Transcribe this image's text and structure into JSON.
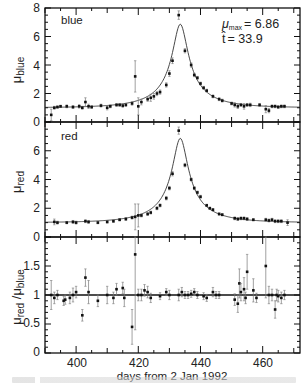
{
  "chart_data": [
    {
      "type": "scatter",
      "panel": "top",
      "panel_label": "blue",
      "ylabel": "μ_blue",
      "ylabel_main": "μ",
      "ylabel_sub": "blue",
      "xlabel": "days from 2 Jan 1992",
      "xlim": [
        390,
        472
      ],
      "ylim": [
        0,
        8
      ],
      "yticks": [
        0,
        2,
        4,
        6,
        8
      ],
      "xticks": [
        400,
        420,
        440,
        460
      ],
      "annotations": {
        "mu_max_label": "μ",
        "mu_max_sub": "max",
        "mu_max_value": "= 6.86",
        "t_hat_label": "t̂",
        "t_hat_value": "= 33.9"
      },
      "fit_curve": {
        "model": "microlensing",
        "t0": 433.5,
        "umin_peak": 6.86,
        "tE": 33.9
      },
      "points": [
        {
          "x": 392,
          "y": 0.5,
          "err": 0.4
        },
        {
          "x": 393,
          "y": 1.0,
          "err": 0.1
        },
        {
          "x": 394,
          "y": 1.05,
          "err": 0.08
        },
        {
          "x": 395,
          "y": 1.1,
          "err": 0.08
        },
        {
          "x": 397,
          "y": 1.1,
          "err": 0.1
        },
        {
          "x": 399,
          "y": 1.05,
          "err": 0.1
        },
        {
          "x": 401,
          "y": 1.1,
          "err": 0.12
        },
        {
          "x": 402,
          "y": 1.0,
          "err": 0.1
        },
        {
          "x": 403,
          "y": 1.4,
          "err": 0.3
        },
        {
          "x": 404,
          "y": 1.1,
          "err": 0.15
        },
        {
          "x": 405,
          "y": 1.05,
          "err": 0.1
        },
        {
          "x": 408,
          "y": 1.15,
          "err": 0.1
        },
        {
          "x": 410,
          "y": 1.0,
          "err": 0.15
        },
        {
          "x": 411,
          "y": 1.1,
          "err": 0.1
        },
        {
          "x": 413,
          "y": 1.2,
          "err": 0.1
        },
        {
          "x": 414,
          "y": 1.2,
          "err": 0.1
        },
        {
          "x": 415,
          "y": 1.15,
          "err": 0.12
        },
        {
          "x": 416,
          "y": 1.2,
          "err": 0.1
        },
        {
          "x": 418,
          "y": 1.3,
          "err": 0.12
        },
        {
          "x": 419,
          "y": 3.2,
          "err": 1.1
        },
        {
          "x": 420,
          "y": 1.1,
          "err": 0.6
        },
        {
          "x": 421,
          "y": 1.4,
          "err": 0.2
        },
        {
          "x": 423,
          "y": 1.6,
          "err": 0.15
        },
        {
          "x": 424,
          "y": 1.7,
          "err": 0.25
        },
        {
          "x": 425,
          "y": 1.8,
          "err": 0.2
        },
        {
          "x": 426,
          "y": 2.0,
          "err": 0.15
        },
        {
          "x": 427,
          "y": 2.1,
          "err": 0.15
        },
        {
          "x": 429,
          "y": 2.6,
          "err": 0.15
        },
        {
          "x": 430,
          "y": 3.4,
          "err": 0.2
        },
        {
          "x": 431,
          "y": 4.3,
          "err": 0.2
        },
        {
          "x": 433,
          "y": 7.5,
          "err": 0.3
        },
        {
          "x": 435,
          "y": 5.0,
          "err": 0.15
        },
        {
          "x": 437,
          "y": 4.0,
          "err": 0.15
        },
        {
          "x": 438,
          "y": 3.3,
          "err": 0.12
        },
        {
          "x": 439,
          "y": 3.1,
          "err": 0.1
        },
        {
          "x": 440,
          "y": 2.7,
          "err": 0.1
        },
        {
          "x": 441,
          "y": 2.4,
          "err": 0.1
        },
        {
          "x": 442,
          "y": 2.2,
          "err": 0.1
        },
        {
          "x": 444,
          "y": 1.8,
          "err": 0.1
        },
        {
          "x": 446,
          "y": 1.6,
          "err": 0.1
        },
        {
          "x": 447,
          "y": 1.5,
          "err": 0.1
        },
        {
          "x": 450,
          "y": 1.3,
          "err": 0.1
        },
        {
          "x": 451,
          "y": 1.2,
          "err": 0.15
        },
        {
          "x": 452,
          "y": 1.1,
          "err": 0.15
        },
        {
          "x": 453,
          "y": 1.2,
          "err": 0.1
        },
        {
          "x": 454,
          "y": 1.1,
          "err": 0.2
        },
        {
          "x": 455,
          "y": 1.2,
          "err": 0.1
        },
        {
          "x": 456,
          "y": 1.2,
          "err": 0.12
        },
        {
          "x": 459,
          "y": 1.2,
          "err": 0.1
        },
        {
          "x": 461,
          "y": 0.9,
          "err": 0.25
        },
        {
          "x": 462,
          "y": 0.8,
          "err": 0.15
        },
        {
          "x": 463,
          "y": 1.1,
          "err": 0.1
        },
        {
          "x": 464,
          "y": 1.1,
          "err": 0.1
        },
        {
          "x": 465,
          "y": 1.05,
          "err": 0.1
        },
        {
          "x": 466,
          "y": 1.1,
          "err": 0.1
        },
        {
          "x": 467,
          "y": 1.1,
          "err": 0.1
        }
      ]
    },
    {
      "type": "scatter",
      "panel": "middle",
      "panel_label": "red",
      "ylabel": "μ_red",
      "ylabel_main": "μ",
      "ylabel_sub": "red",
      "xlim": [
        390,
        472
      ],
      "ylim": [
        0,
        8
      ],
      "yticks": [
        0,
        2,
        4,
        6
      ],
      "points": [
        {
          "x": 393,
          "y": 1.05,
          "err": 0.2
        },
        {
          "x": 394,
          "y": 1.0,
          "err": 0.1
        },
        {
          "x": 397,
          "y": 1.0,
          "err": 0.08
        },
        {
          "x": 399,
          "y": 1.05,
          "err": 0.1
        },
        {
          "x": 400,
          "y": 1.0,
          "err": 0.1
        },
        {
          "x": 403,
          "y": 1.1,
          "err": 0.1
        },
        {
          "x": 404,
          "y": 1.05,
          "err": 0.1
        },
        {
          "x": 407,
          "y": 1.0,
          "err": 0.08
        },
        {
          "x": 410,
          "y": 1.05,
          "err": 0.08
        },
        {
          "x": 412,
          "y": 1.1,
          "err": 0.08
        },
        {
          "x": 414,
          "y": 1.2,
          "err": 0.08
        },
        {
          "x": 416,
          "y": 1.25,
          "err": 0.1
        },
        {
          "x": 418,
          "y": 1.35,
          "err": 0.1
        },
        {
          "x": 419,
          "y": 1.4,
          "err": 0.9
        },
        {
          "x": 420,
          "y": 1.5,
          "err": 0.8
        },
        {
          "x": 421,
          "y": 1.5,
          "err": 0.1
        },
        {
          "x": 423,
          "y": 1.6,
          "err": 0.1
        },
        {
          "x": 424,
          "y": 1.7,
          "err": 0.1
        },
        {
          "x": 426,
          "y": 2.0,
          "err": 0.1
        },
        {
          "x": 427,
          "y": 2.2,
          "err": 0.1
        },
        {
          "x": 429,
          "y": 2.7,
          "err": 0.12
        },
        {
          "x": 430,
          "y": 3.4,
          "err": 0.12
        },
        {
          "x": 431,
          "y": 4.4,
          "err": 0.15
        },
        {
          "x": 433,
          "y": 7.4,
          "err": 0.25
        },
        {
          "x": 435,
          "y": 5.0,
          "err": 0.12
        },
        {
          "x": 437,
          "y": 4.0,
          "err": 0.1
        },
        {
          "x": 438,
          "y": 3.4,
          "err": 0.1
        },
        {
          "x": 439,
          "y": 3.1,
          "err": 0.1
        },
        {
          "x": 440,
          "y": 2.8,
          "err": 0.1
        },
        {
          "x": 442,
          "y": 2.2,
          "err": 0.08
        },
        {
          "x": 443,
          "y": 2.0,
          "err": 0.08
        },
        {
          "x": 444,
          "y": 1.9,
          "err": 0.08
        },
        {
          "x": 446,
          "y": 1.6,
          "err": 0.08
        },
        {
          "x": 447,
          "y": 1.55,
          "err": 0.08
        },
        {
          "x": 451,
          "y": 1.3,
          "err": 0.1
        },
        {
          "x": 452,
          "y": 1.25,
          "err": 0.1
        },
        {
          "x": 453,
          "y": 1.3,
          "err": 0.1
        },
        {
          "x": 454,
          "y": 1.3,
          "err": 0.1
        },
        {
          "x": 455,
          "y": 1.25,
          "err": 0.1
        },
        {
          "x": 457,
          "y": 1.2,
          "err": 0.08
        },
        {
          "x": 461,
          "y": 1.2,
          "err": 0.1
        },
        {
          "x": 462,
          "y": 1.15,
          "err": 0.1
        },
        {
          "x": 463,
          "y": 1.2,
          "err": 0.1
        },
        {
          "x": 464,
          "y": 1.1,
          "err": 0.1
        },
        {
          "x": 465,
          "y": 1.1,
          "err": 0.1
        },
        {
          "x": 466,
          "y": 1.1,
          "err": 0.1
        },
        {
          "x": 468,
          "y": 1.0,
          "err": 0.2
        }
      ]
    },
    {
      "type": "scatter",
      "panel": "bottom",
      "ylabel": "μ_red / μ_blue",
      "ylabel_main": "μ",
      "ylabel_sub": "red",
      "ylabel_mid": " /μ",
      "ylabel_sub2": "blue",
      "xlabel": "days from 2 Jan 1992",
      "xlim": [
        390,
        472
      ],
      "ylim": [
        0,
        2
      ],
      "yticks": [
        0,
        0.5,
        1,
        1.5
      ],
      "ytick_labels": [
        "0",
        "0.5",
        "1",
        "1.5"
      ],
      "xticks": [
        400,
        420,
        440,
        460
      ],
      "reference_line": 1,
      "points": [
        {
          "x": 392,
          "y": 1.0,
          "err": 0.25
        },
        {
          "x": 393,
          "y": 0.95,
          "err": 0.1
        },
        {
          "x": 394,
          "y": 1.0,
          "err": 0.08
        },
        {
          "x": 396,
          "y": 0.9,
          "err": 0.08
        },
        {
          "x": 396.5,
          "y": 0.92,
          "err": 0.08
        },
        {
          "x": 398,
          "y": 0.95,
          "err": 0.1
        },
        {
          "x": 399,
          "y": 1.0,
          "err": 0.12
        },
        {
          "x": 400,
          "y": 1.05,
          "err": 0.1
        },
        {
          "x": 402,
          "y": 0.65,
          "err": 0.1
        },
        {
          "x": 403,
          "y": 1.3,
          "err": 0.15
        },
        {
          "x": 404,
          "y": 1.05,
          "err": 0.2
        },
        {
          "x": 407,
          "y": 0.9,
          "err": 0.1
        },
        {
          "x": 410,
          "y": 1.0,
          "err": 0.15
        },
        {
          "x": 412,
          "y": 0.95,
          "err": 0.1
        },
        {
          "x": 413,
          "y": 1.1,
          "err": 0.1
        },
        {
          "x": 415,
          "y": 1.12,
          "err": 0.1
        },
        {
          "x": 415.5,
          "y": 0.95,
          "err": 0.15
        },
        {
          "x": 418,
          "y": 0.45,
          "err": 0.3
        },
        {
          "x": 419,
          "y": 1.7,
          "err": 1.3
        },
        {
          "x": 420,
          "y": 1.0,
          "err": 0.1
        },
        {
          "x": 421,
          "y": 1.0,
          "err": 0.1
        },
        {
          "x": 422,
          "y": 1.08,
          "err": 0.1
        },
        {
          "x": 423,
          "y": 1.05,
          "err": 0.1
        },
        {
          "x": 424,
          "y": 0.95,
          "err": 0.08
        },
        {
          "x": 427,
          "y": 0.98,
          "err": 0.06
        },
        {
          "x": 429,
          "y": 1.05,
          "err": 0.06
        },
        {
          "x": 430,
          "y": 1.0,
          "err": 0.08
        },
        {
          "x": 433,
          "y": 1.0,
          "err": 0.1
        },
        {
          "x": 434,
          "y": 1.05,
          "err": 0.08
        },
        {
          "x": 435,
          "y": 1.0,
          "err": 0.06
        },
        {
          "x": 436,
          "y": 1.0,
          "err": 0.06
        },
        {
          "x": 437,
          "y": 1.02,
          "err": 0.06
        },
        {
          "x": 438,
          "y": 1.05,
          "err": 0.06
        },
        {
          "x": 439,
          "y": 1.0,
          "err": 0.06
        },
        {
          "x": 441,
          "y": 0.98,
          "err": 0.06
        },
        {
          "x": 442,
          "y": 0.95,
          "err": 0.06
        },
        {
          "x": 444,
          "y": 1.05,
          "err": 0.08
        },
        {
          "x": 445,
          "y": 1.0,
          "err": 0.06
        },
        {
          "x": 446,
          "y": 1.0,
          "err": 0.06
        },
        {
          "x": 451,
          "y": 0.92,
          "err": 0.1
        },
        {
          "x": 452,
          "y": 0.85,
          "err": 0.15
        },
        {
          "x": 452.5,
          "y": 1.2,
          "err": 0.25
        },
        {
          "x": 453,
          "y": 1.05,
          "err": 0.15
        },
        {
          "x": 454,
          "y": 1.1,
          "err": 0.2
        },
        {
          "x": 454.5,
          "y": 0.95,
          "err": 0.1
        },
        {
          "x": 455,
          "y": 1.4,
          "err": 0.3
        },
        {
          "x": 457,
          "y": 1.08,
          "err": 0.2
        },
        {
          "x": 458,
          "y": 0.95,
          "err": 0.08
        },
        {
          "x": 461,
          "y": 1.5,
          "err": 0.55
        },
        {
          "x": 462,
          "y": 1.0,
          "err": 0.15
        },
        {
          "x": 463,
          "y": 1.0,
          "err": 0.1
        },
        {
          "x": 464,
          "y": 0.75,
          "err": 0.15
        },
        {
          "x": 464.5,
          "y": 1.0,
          "err": 0.1
        },
        {
          "x": 465,
          "y": 0.98,
          "err": 0.1
        },
        {
          "x": 466,
          "y": 0.95,
          "err": 0.1
        },
        {
          "x": 467,
          "y": 1.0,
          "err": 0.08
        }
      ]
    }
  ],
  "figure": {
    "xlabel": "days from 2 Jan 1992",
    "panel_labels": {
      "top": "blue",
      "middle": "red"
    },
    "tick_labels_x": [
      "400",
      "420",
      "440",
      "460"
    ],
    "tick_labels_top_y": [
      "8",
      "6",
      "4",
      "2",
      "0"
    ],
    "tick_labels_mid_y": [
      "6",
      "4",
      "2",
      "0"
    ],
    "tick_labels_bot_y": [
      "1.5",
      "1",
      "0.5",
      "0"
    ],
    "annotation_mu": "μ",
    "annotation_mu_sub": "max",
    "annotation_mu_value": "= 6.86",
    "annotation_t": "t̂",
    "annotation_t_value": "= 33.9",
    "ylabel_top_main": "μ",
    "ylabel_top_sub": "blue",
    "ylabel_mid_main": "μ",
    "ylabel_mid_sub": "red",
    "ylabel_bot_main": "μ",
    "ylabel_bot_sub": "red",
    "ylabel_bot_mid": " /μ",
    "ylabel_bot_sub2": "blue",
    "colors": {
      "axes": "#111111",
      "points": "#111111",
      "errorbars": "#666666",
      "curve": "#333333",
      "background": "#ffffff"
    }
  }
}
